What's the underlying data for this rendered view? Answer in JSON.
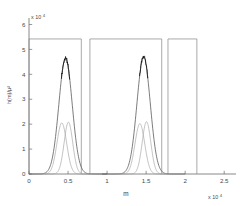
{
  "chart_data": {
    "type": "line",
    "title": "",
    "subtitle": "",
    "xlabel": "m",
    "ylabel": "h(m)/µ²",
    "xlim": [
      0,
      2.6
    ],
    "ylim": [
      0,
      6.1
    ],
    "x_tick_labels": [
      "0",
      "0.5",
      "1",
      "1.5",
      "2",
      "2.5"
    ],
    "x_tick_values": [
      0,
      0.5,
      1,
      1.5,
      2,
      2.5
    ],
    "y_tick_labels": [
      "0",
      "1",
      "2",
      "3",
      "4",
      "5",
      "6"
    ],
    "y_tick_values": [
      0,
      1,
      2,
      3,
      4,
      5,
      6
    ],
    "x_exponent_label": "x 10",
    "x_exponent_power": "4",
    "y_exponent_label": "x 10",
    "y_exponent_power": "4",
    "grid": false,
    "legend": "none",
    "box": false,
    "series": [
      {
        "name": "rectangular envelope",
        "kind": "step",
        "level": 5.42,
        "color": "#8d8d8d",
        "segments": [
          {
            "x_start": 0.0,
            "x_end": 0.67,
            "y": 5.42
          },
          {
            "x_start": 0.78,
            "x_end": 1.7,
            "y": 5.42
          },
          {
            "x_start": 1.78,
            "x_end": 2.15,
            "y": 5.42
          }
        ]
      },
      {
        "name": "main peak cluster 1",
        "kind": "peak",
        "color": "#5a5a5a",
        "center": 0.468,
        "amplitude": 4.65,
        "width": 0.085
      },
      {
        "name": "main peak cluster 2",
        "kind": "peak",
        "color": "#5a5a5a",
        "center": 1.468,
        "amplitude": 4.7,
        "width": 0.085
      },
      {
        "name": "sub peak 1 left",
        "kind": "peak",
        "color": "#a8a8a8",
        "center": 0.42,
        "amplitude": 2.05,
        "width": 0.062
      },
      {
        "name": "sub peak 1 right",
        "kind": "peak",
        "color": "#a8a8a8",
        "center": 0.505,
        "amplitude": 2.08,
        "width": 0.055
      },
      {
        "name": "sub peak 2 left",
        "kind": "peak",
        "color": "#a8a8a8",
        "center": 1.42,
        "amplitude": 2.02,
        "width": 0.062
      },
      {
        "name": "sub peak 2 right",
        "kind": "peak",
        "color": "#a8a8a8",
        "center": 1.505,
        "amplitude": 2.1,
        "width": 0.055
      },
      {
        "name": "noisy peak cap 1",
        "kind": "noise-cap",
        "color": "#141414",
        "center": 0.468,
        "amplitude": 4.65,
        "jitter": 0.16
      },
      {
        "name": "noisy peak cap 2",
        "kind": "noise-cap",
        "color": "#141414",
        "center": 1.468,
        "amplitude": 4.7,
        "jitter": 0.14
      }
    ]
  },
  "colors": {
    "axis": "#6b6b6b",
    "tick_text": "#4a4a4a",
    "step_curve": "#8d8d8d",
    "main_peak": "#5a5a5a",
    "sub_peak": "#a8a8a8",
    "noise_cap": "#141414",
    "background": "#ffffff"
  }
}
